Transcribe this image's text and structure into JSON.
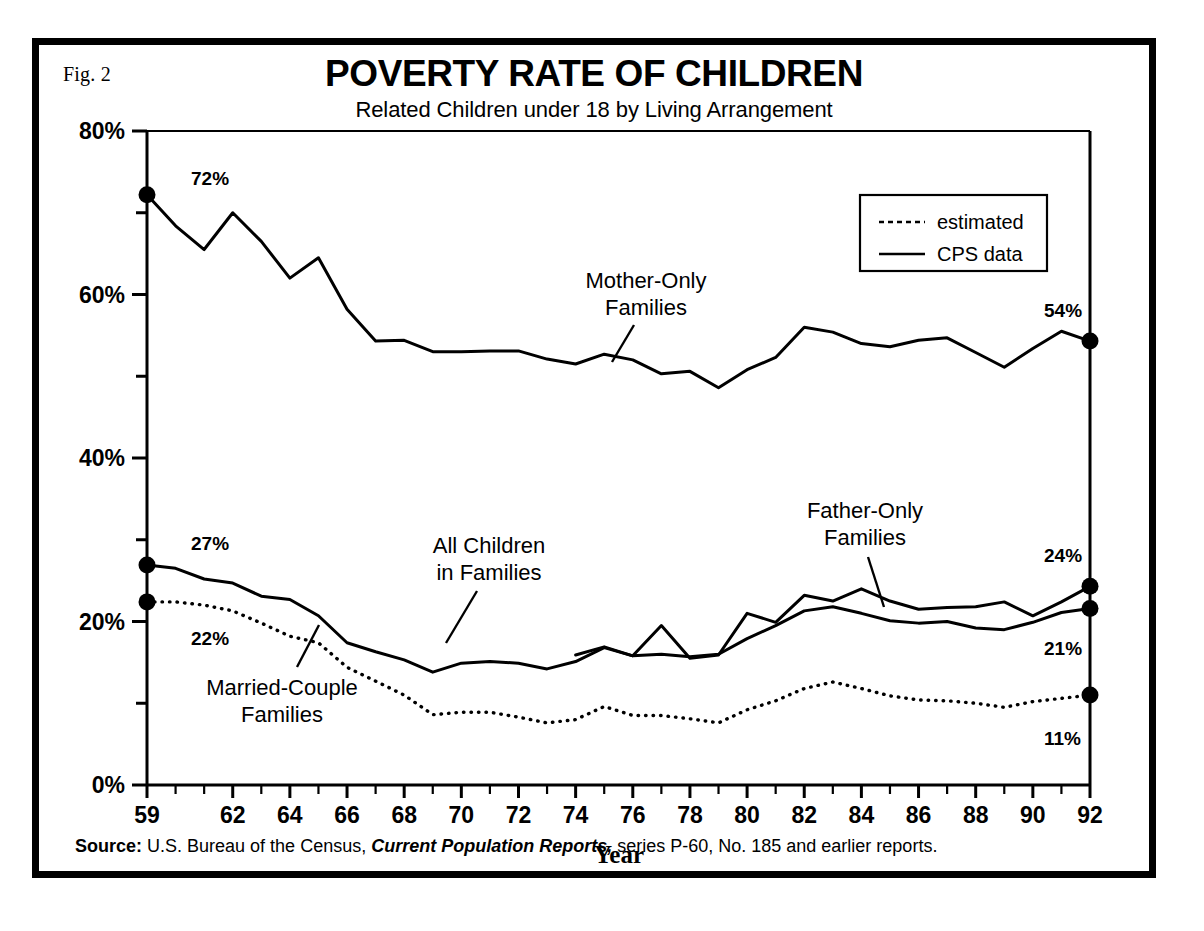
{
  "figure": {
    "fig_label": "Fig. 2",
    "title": "POVERTY RATE OF CHILDREN",
    "subtitle": "Related Children under 18 by Living Arrangement",
    "source_prefix": "Source:",
    "source_text_1": "U.S. Bureau of the Census,",
    "source_italic": "Current Population Reports,",
    "source_text_2": "series P-60, No. 185 and earlier reports.",
    "ink_color": "#000000",
    "paper_color": "#ffffff"
  },
  "legend": {
    "position": "top-right-inside-plot",
    "entries": [
      {
        "label": "estimated",
        "style": "dotted"
      },
      {
        "label": "CPS data",
        "style": "solid"
      }
    ]
  },
  "annotations": [
    {
      "name": "mother-only",
      "line1": "Mother-Only",
      "line2": "Families"
    },
    {
      "name": "father-only",
      "line1": "Father-Only",
      "line2": "Families"
    },
    {
      "name": "all-children",
      "line1": "All  Children",
      "line2": "in Families"
    },
    {
      "name": "married-couple",
      "line1": "Married-Couple",
      "line2": "Families"
    }
  ],
  "endpoint_labels": {
    "mother_start": "72%",
    "mother_end": "54%",
    "all_children_start": "27%",
    "all_children_end": "21%",
    "married_start": "22%",
    "married_end": "11%",
    "father_end": "24%"
  },
  "chart_data": {
    "type": "line",
    "title": "POVERTY RATE OF CHILDREN",
    "subtitle": "Related Children under 18 by Living Arrangement",
    "xlabel": "Year",
    "ylabel": "",
    "xlim": [
      1959,
      1992
    ],
    "ylim": [
      0,
      80
    ],
    "grid": false,
    "legend_position": "upper right",
    "y_tick_labels": [
      "0%",
      "20%",
      "40%",
      "60%",
      "80%"
    ],
    "y_ticks_major": [
      0,
      20,
      40,
      60,
      80
    ],
    "y_ticks_minor": [
      10,
      30,
      50,
      70
    ],
    "x_tick_labels": [
      "59",
      "62",
      "64",
      "66",
      "68",
      "70",
      "72",
      "74",
      "76",
      "78",
      "80",
      "82",
      "84",
      "86",
      "88",
      "90",
      "92"
    ],
    "x_ticks_labeled": [
      1959,
      1962,
      1964,
      1966,
      1968,
      1970,
      1972,
      1974,
      1976,
      1978,
      1980,
      1982,
      1984,
      1986,
      1988,
      1990,
      1992
    ],
    "x_ticks_all_years": true,
    "series": [
      {
        "name": "Mother-Only Families",
        "style": "solid",
        "marker_start": true,
        "marker_end": true,
        "x": [
          1959,
          1960,
          1961,
          1962,
          1963,
          1964,
          1965,
          1966,
          1967,
          1968,
          1969,
          1970,
          1971,
          1972,
          1973,
          1974,
          1975,
          1976,
          1977,
          1978,
          1979,
          1980,
          1981,
          1982,
          1983,
          1984,
          1985,
          1986,
          1987,
          1988,
          1989,
          1990,
          1991,
          1992
        ],
        "values": [
          72.2,
          68.4,
          65.5,
          70.0,
          66.5,
          62.0,
          64.5,
          58.2,
          54.3,
          54.4,
          53.0,
          53.0,
          53.1,
          53.1,
          52.1,
          51.5,
          52.7,
          52.0,
          50.3,
          50.6,
          48.6,
          50.8,
          52.3,
          56.0,
          55.4,
          54.0,
          53.6,
          54.4,
          54.7,
          52.9,
          51.1,
          53.4,
          55.5,
          54.3
        ]
      },
      {
        "name": "Father-Only Families",
        "style": "solid",
        "marker_start": false,
        "marker_end": true,
        "x": [
          1974,
          1975,
          1976,
          1977,
          1978,
          1979,
          1980,
          1981,
          1982,
          1983,
          1984,
          1985,
          1986,
          1987,
          1988,
          1989,
          1990,
          1991,
          1992
        ],
        "values": [
          15.9,
          16.9,
          15.8,
          19.5,
          15.5,
          15.9,
          21.0,
          19.9,
          23.2,
          22.5,
          24.0,
          22.5,
          21.5,
          21.7,
          21.8,
          22.4,
          20.7,
          22.4,
          24.3
        ]
      },
      {
        "name": "All Children in Families",
        "style": "solid",
        "marker_start": true,
        "marker_end": true,
        "x": [
          1959,
          1960,
          1961,
          1962,
          1963,
          1964,
          1965,
          1966,
          1967,
          1968,
          1969,
          1970,
          1971,
          1972,
          1973,
          1974,
          1975,
          1976,
          1977,
          1978,
          1979,
          1980,
          1981,
          1982,
          1983,
          1984,
          1985,
          1986,
          1987,
          1988,
          1989,
          1990,
          1991,
          1992
        ],
        "values": [
          26.9,
          26.5,
          25.2,
          24.7,
          23.1,
          22.7,
          20.7,
          17.4,
          16.3,
          15.3,
          13.8,
          14.9,
          15.1,
          14.9,
          14.2,
          15.1,
          16.8,
          15.8,
          16.0,
          15.7,
          16.0,
          17.9,
          19.5,
          21.3,
          21.8,
          21.0,
          20.1,
          19.8,
          20.0,
          19.2,
          19.0,
          19.9,
          21.1,
          21.6
        ]
      },
      {
        "name": "Married-Couple Families",
        "style": "dotted",
        "marker_start": true,
        "marker_end": true,
        "x": [
          1959,
          1960,
          1961,
          1962,
          1963,
          1964,
          1965,
          1966,
          1967,
          1968,
          1969,
          1970,
          1971,
          1972,
          1973,
          1974,
          1975,
          1976,
          1977,
          1978,
          1979,
          1980,
          1981,
          1982,
          1983,
          1984,
          1985,
          1986,
          1987,
          1988,
          1989,
          1990,
          1991,
          1992
        ],
        "values": [
          22.4,
          22.4,
          22.0,
          21.3,
          19.8,
          18.2,
          17.4,
          14.4,
          12.7,
          11.0,
          8.6,
          8.9,
          8.9,
          8.3,
          7.6,
          8.0,
          9.6,
          8.5,
          8.5,
          8.1,
          7.6,
          9.2,
          10.3,
          11.8,
          12.6,
          11.8,
          10.9,
          10.4,
          10.3,
          10.0,
          9.5,
          10.2,
          10.6,
          11.0
        ]
      }
    ]
  }
}
